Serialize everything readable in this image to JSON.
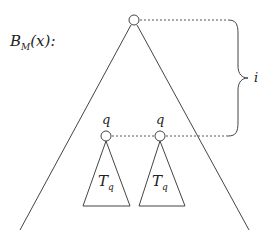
{
  "diagram": {
    "title_label": {
      "main": "B",
      "sub": "M",
      "rest": "(x):"
    },
    "root_node": {
      "cx": 134,
      "cy": 20,
      "r": 5
    },
    "outer_triangle": {
      "apex": [
        134,
        20
      ],
      "left_base": [
        20,
        230
      ],
      "right_base": [
        249,
        230
      ]
    },
    "subtree_nodes": [
      {
        "label": "q",
        "cx": 106,
        "cy": 136,
        "r": 5,
        "subtree_label": {
          "main": "T",
          "sub": "q"
        },
        "base": [
          83,
          130,
          206
        ]
      },
      {
        "label": "q",
        "cx": 160,
        "cy": 136,
        "r": 5,
        "subtree_label": {
          "main": "T",
          "sub": "q"
        },
        "base": [
          139,
          185,
          206
        ]
      }
    ],
    "brace": {
      "label": "i",
      "top_y": 20,
      "bottom_y": 136,
      "x": 230,
      "tip_x": 248,
      "mid_y": 78
    },
    "colors": {
      "stroke": "#444444",
      "background": "#ffffff"
    }
  }
}
